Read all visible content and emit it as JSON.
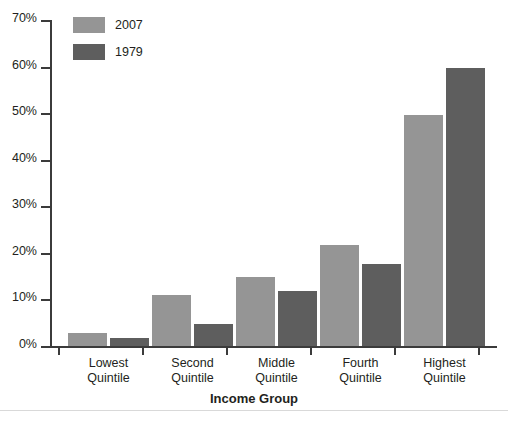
{
  "chart_data": {
    "type": "bar",
    "title": "",
    "subtitle": "",
    "xlabel": "Income Group",
    "ylabel": "",
    "categories": [
      "Lowest Quintile",
      "Second Quintile",
      "Middle Quintile",
      "Fourth Quintile",
      "Highest Quintile"
    ],
    "category_lines": [
      [
        "Lowest",
        "Quintile"
      ],
      [
        "Second",
        "Quintile"
      ],
      [
        "Middle",
        "Quintile"
      ],
      [
        "Fourth",
        "Quintile"
      ],
      [
        "Highest",
        "Quintile"
      ]
    ],
    "series": [
      {
        "name": "2007",
        "color": "#959595",
        "values": [
          2.8,
          11.0,
          14.9,
          21.7,
          49.7
        ]
      },
      {
        "name": "1979",
        "color": "#5e5e5e",
        "values": [
          1.8,
          4.8,
          11.8,
          17.6,
          59.7
        ]
      }
    ],
    "ylim": [
      0,
      70
    ],
    "ytick_values": [
      0,
      10,
      20,
      30,
      40,
      50,
      60,
      70
    ],
    "ytick_labels": [
      "0%",
      "10%",
      "20%",
      "30%",
      "40%",
      "50%",
      "60%",
      "70%"
    ],
    "grid": false,
    "legend_position": "top-left-inside",
    "value_unit": "percent"
  },
  "legend": {
    "entries": [
      {
        "label": "2007",
        "color": "#959595"
      },
      {
        "label": "1979",
        "color": "#5e5e5e"
      }
    ]
  },
  "axis": {
    "x_title": "Income Group"
  },
  "colors": {
    "series_2007": "#959595",
    "series_1979": "#5e5e5e",
    "axis": "#3b3b3b",
    "text": "#231f20",
    "background": "#ffffff",
    "rule": "#d9d9d9"
  }
}
